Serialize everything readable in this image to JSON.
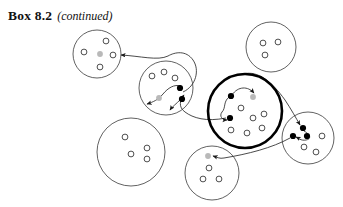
{
  "caption": {
    "box_label": "Box 8.2",
    "continued_label": "(continued)"
  },
  "colors": {
    "outline": "#3a3a3a",
    "outline_bold": "#000000",
    "dot_open_stroke": "#3a3a3a",
    "dot_filled": "#000000",
    "dot_gray": "#b9b9b9",
    "connector": "#2b2b2b",
    "background": "#ffffff"
  },
  "legend_semantics": {
    "open_dot": "uninfected / susceptible individual",
    "gray_dot": "newly seeded individual",
    "filled_dot": "infected individual",
    "bold_circle": "focal population",
    "thin_circle": "population",
    "arrow": "transmission between populations"
  },
  "chart_data": {
    "type": "diagram",
    "node_shape": "circle",
    "populations": [
      {
        "id": "p-top-left",
        "name": "top-left-population",
        "cx": 97,
        "cy": 54,
        "r": 24,
        "bold": false,
        "dots": [
          {
            "kind": "open",
            "x": 106,
            "y": 41
          },
          {
            "kind": "open",
            "x": 84,
            "y": 52
          },
          {
            "kind": "open",
            "x": 113,
            "y": 55
          },
          {
            "kind": "open",
            "x": 100,
            "y": 67
          },
          {
            "kind": "gray",
            "x": 100,
            "y": 54
          }
        ]
      },
      {
        "id": "p-upper-mid",
        "name": "upper-middle-population",
        "cx": 166,
        "cy": 88,
        "r": 27,
        "bold": false,
        "dots": [
          {
            "kind": "open",
            "x": 152,
            "y": 76
          },
          {
            "kind": "open",
            "x": 164,
            "y": 72
          },
          {
            "kind": "open",
            "x": 175,
            "y": 78
          },
          {
            "kind": "filled",
            "x": 180,
            "y": 88
          },
          {
            "kind": "filled",
            "x": 182,
            "y": 99
          },
          {
            "kind": "gray",
            "x": 159,
            "y": 98
          }
        ]
      },
      {
        "id": "p-top-right",
        "name": "top-right-population",
        "cx": 271,
        "cy": 47,
        "r": 25,
        "bold": false,
        "dots": [
          {
            "kind": "open",
            "x": 263,
            "y": 43
          },
          {
            "kind": "open",
            "x": 278,
            "y": 42
          },
          {
            "kind": "open",
            "x": 265,
            "y": 55
          }
        ]
      },
      {
        "id": "p-focal",
        "name": "focal-population-bold",
        "cx": 245,
        "cy": 111,
        "r": 37,
        "bold": true,
        "dots": [
          {
            "kind": "filled",
            "x": 231,
            "y": 96
          },
          {
            "kind": "gray",
            "x": 253,
            "y": 97
          },
          {
            "kind": "open",
            "x": 241,
            "y": 108
          },
          {
            "kind": "filled",
            "x": 230,
            "y": 118
          },
          {
            "kind": "open",
            "x": 253,
            "y": 118
          },
          {
            "kind": "open",
            "x": 264,
            "y": 114
          },
          {
            "kind": "open",
            "x": 231,
            "y": 130
          },
          {
            "kind": "open",
            "x": 247,
            "y": 133
          },
          {
            "kind": "open",
            "x": 262,
            "y": 128
          }
        ]
      },
      {
        "id": "p-right",
        "name": "right-population",
        "cx": 308,
        "cy": 138,
        "r": 26,
        "bold": false,
        "dots": [
          {
            "kind": "filled",
            "x": 303,
            "y": 128
          },
          {
            "kind": "filled",
            "x": 293,
            "y": 136
          },
          {
            "kind": "filled",
            "x": 307,
            "y": 136
          },
          {
            "kind": "open",
            "x": 322,
            "y": 136
          },
          {
            "kind": "open",
            "x": 304,
            "y": 147
          },
          {
            "kind": "open",
            "x": 316,
            "y": 152
          }
        ]
      },
      {
        "id": "p-bottom-left",
        "name": "bottom-left-population",
        "cx": 131,
        "cy": 152,
        "r": 34,
        "bold": false,
        "dots": [
          {
            "kind": "open",
            "x": 125,
            "y": 137
          },
          {
            "kind": "open",
            "x": 131,
            "y": 154
          },
          {
            "kind": "open",
            "x": 147,
            "y": 148
          },
          {
            "kind": "open",
            "x": 147,
            "y": 159
          }
        ]
      },
      {
        "id": "p-bottom-mid",
        "name": "bottom-middle-population",
        "cx": 212,
        "cy": 173,
        "r": 27,
        "bold": false,
        "dots": [
          {
            "kind": "gray",
            "x": 208,
            "y": 156
          },
          {
            "kind": "open",
            "x": 209,
            "y": 168
          },
          {
            "kind": "open",
            "x": 203,
            "y": 179
          },
          {
            "kind": "open",
            "x": 219,
            "y": 179
          }
        ]
      }
    ],
    "connectors": [
      {
        "id": "c-upper-to-topleft",
        "from": "p-upper-mid",
        "to": "p-top-left",
        "arrow": true
      },
      {
        "id": "c-upper-internal-1",
        "from": "p-upper-mid",
        "to": "p-upper-mid",
        "arrow": true
      },
      {
        "id": "c-upper-internal-2",
        "from": "p-upper-mid",
        "to": "p-upper-mid",
        "arrow": true
      },
      {
        "id": "c-focal-to-upper",
        "from": "p-focal",
        "to": "p-upper-mid",
        "arrow": true
      },
      {
        "id": "c-focal-internal-1",
        "from": "p-focal",
        "to": "p-focal",
        "arrow": true
      },
      {
        "id": "c-focal-internal-2",
        "from": "p-focal",
        "to": "p-focal",
        "arrow": true
      },
      {
        "id": "c-focal-to-right",
        "from": "p-focal",
        "to": "p-right",
        "arrow": true
      },
      {
        "id": "c-right-internal",
        "from": "p-right",
        "to": "p-right",
        "arrow": true
      },
      {
        "id": "c-right-to-bottommid",
        "from": "p-right",
        "to": "p-bottom-mid",
        "arrow": true
      }
    ]
  }
}
